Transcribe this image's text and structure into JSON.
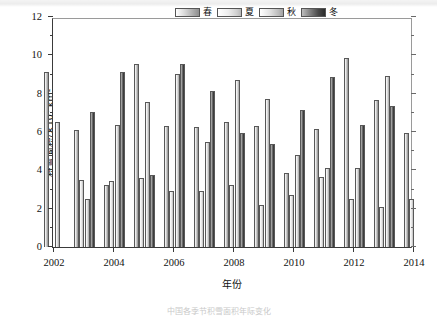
{
  "figure": {
    "y_axis_title_main": "积雪面积/×10",
    "y_axis_title_exp": "4",
    "y_axis_title_unit": " km²",
    "x_axis_title": "年份",
    "caption": "中国各季节积雪面积年际变化"
  },
  "legend": {
    "position": "top-right",
    "items": [
      {
        "label": "春",
        "name": "spring",
        "swatch": "s-spring"
      },
      {
        "label": "夏",
        "name": "summer",
        "swatch": "s-summer"
      },
      {
        "label": "秋",
        "name": "autumn",
        "swatch": "s-autumn"
      },
      {
        "label": "冬",
        "name": "winter",
        "swatch": "s-winter"
      }
    ]
  },
  "chart_data": {
    "type": "bar",
    "title": "",
    "xlabel": "年份",
    "ylabel": "积雪面积/×10⁴ km²",
    "ylim": [
      0,
      12
    ],
    "ytick_values": [
      0,
      2,
      4,
      6,
      8,
      10,
      12
    ],
    "ytick_labels": [
      "0",
      "2",
      "4",
      "6",
      "8",
      "10",
      "12"
    ],
    "y_minor_ticks": [
      1,
      3,
      5,
      7,
      9,
      11
    ],
    "xlim": [
      2002,
      2014
    ],
    "xtick_values": [
      2002,
      2004,
      2006,
      2008,
      2010,
      2012,
      2014
    ],
    "xtick_labels": [
      "2002",
      "2004",
      "2006",
      "2008",
      "2010",
      "2012",
      "2014"
    ],
    "grid": false,
    "categories": [
      2002,
      2003,
      2004,
      2005,
      2006,
      2007,
      2008,
      2009,
      2010,
      2011,
      2012,
      2013,
      2014
    ],
    "series": [
      {
        "name": "春",
        "values": [
          9.15,
          6.1,
          3.25,
          9.55,
          6.3,
          6.25,
          6.5,
          6.3,
          3.85,
          6.15,
          9.85,
          7.65,
          5.95
        ]
      },
      {
        "name": "夏",
        "values": [
          null,
          3.5,
          3.45,
          3.6,
          2.9,
          2.9,
          3.25,
          2.2,
          2.7,
          3.65,
          2.5,
          2.1,
          2.5
        ]
      },
      {
        "name": "秋",
        "values": [
          6.5,
          2.5,
          6.35,
          7.55,
          9.05,
          5.5,
          8.7,
          7.7,
          4.8,
          4.1,
          4.1,
          8.9,
          null
        ]
      },
      {
        "name": "冬",
        "values": [
          null,
          7.05,
          9.15,
          3.75,
          9.55,
          8.15,
          5.95,
          5.4,
          7.15,
          8.85,
          6.35,
          7.35,
          null
        ]
      }
    ]
  }
}
